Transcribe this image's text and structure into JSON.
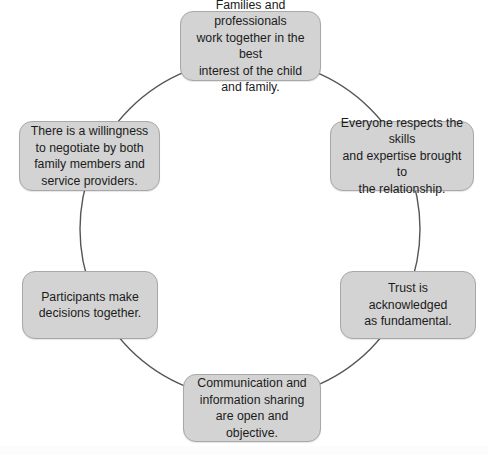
{
  "diagram": {
    "type": "cycle",
    "shape": "circle",
    "background_color": "#ffffff",
    "circle": {
      "center_x": 250,
      "center_y": 229,
      "radius": 170,
      "stroke_color": "#555555",
      "stroke_width": 1.4,
      "fill": "none"
    },
    "node_style": {
      "fill_color": "#d3d3d3",
      "border_color": "#a8a8a8",
      "text_color": "#1b1b1b",
      "corner_radius": 13
    },
    "nodes": [
      {
        "id": "families-professionals",
        "name": "families-and-professionals",
        "position": "top",
        "text": "Families and professionals\nwork together in the best\ninterest of the child\nand family.",
        "x": 180,
        "y": 11,
        "width": 141,
        "height": 70
      },
      {
        "id": "respect-skills",
        "name": "everyone-respects-skills",
        "position": "upper-right",
        "text": "Everyone respects the skills\nand expertise brought to\nthe relationship.",
        "x": 330,
        "y": 121,
        "width": 144,
        "height": 70
      },
      {
        "id": "trust-fundamental",
        "name": "trust-acknowledged",
        "position": "lower-right",
        "text": "Trust is acknowledged\nas fundamental.",
        "x": 340,
        "y": 271,
        "width": 136,
        "height": 68
      },
      {
        "id": "communication-open",
        "name": "communication-and-information-sharing",
        "position": "bottom",
        "text": "Communication and\ninformation sharing\nare open and objective.",
        "x": 183,
        "y": 374,
        "width": 138,
        "height": 68
      },
      {
        "id": "participants-decisions",
        "name": "participants-make-decisions",
        "position": "lower-left",
        "text": "Participants make\ndecisions together.",
        "x": 22,
        "y": 271,
        "width": 136,
        "height": 68
      },
      {
        "id": "willingness-negotiate",
        "name": "willingness-to-negotiate",
        "position": "upper-left",
        "text": "There is a willingness\nto negotiate by both\nfamily members and\nservice providers.",
        "x": 19,
        "y": 121,
        "width": 141,
        "height": 70
      }
    ]
  }
}
